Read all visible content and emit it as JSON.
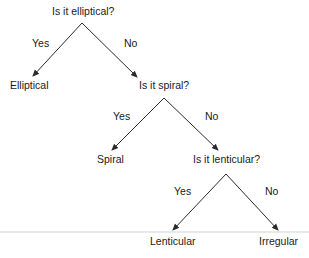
{
  "diagram": {
    "type": "decision-tree",
    "nodes": {
      "q1": "Is it elliptical?",
      "q2": "Is it spiral?",
      "q3": "Is it lenticular?",
      "leaf1": "Elliptical",
      "leaf2": "Spiral",
      "leaf3": "Lenticular",
      "leaf4": "Irregular"
    },
    "edges": {
      "q1_yes": "Yes",
      "q1_no": "No",
      "q2_yes": "Yes",
      "q2_no": "No",
      "q3_yes": "Yes",
      "q3_no": "No"
    },
    "colors": {
      "line": "#2a2a2a",
      "rule": "#cfcfcf"
    }
  }
}
